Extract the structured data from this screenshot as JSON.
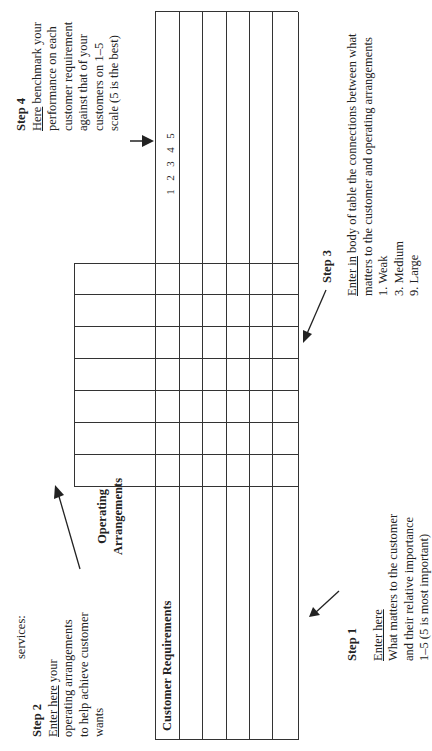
{
  "diagram": {
    "type": "quality-function-deployment-matrix",
    "orientation": "rotated-90-ccw"
  },
  "step1": {
    "title": "Step 1",
    "link": "Enter here",
    "lines": [
      "What matters to the customer",
      "and their relative importance",
      "1–5 (5 is most important)"
    ]
  },
  "step2": {
    "intro": "services:",
    "title": "Step 2",
    "link": "Enter here",
    "link_rest": " your",
    "lines": [
      "operating arrangements",
      "to help achieve customer",
      "wants"
    ]
  },
  "step3": {
    "title": "Step 3",
    "link": "Enter in",
    "link_rest": " body of table the connections between what",
    "line2": "matters to the customer and operating arrangements",
    "scale": [
      "1.  Weak",
      "3.  Medium",
      "9.  Large"
    ]
  },
  "step4": {
    "title": "Step 4",
    "link": "Here",
    "link_rest": " benchmark your",
    "lines": [
      "performance on each",
      "customer requirement",
      "against that of your",
      "customers on 1–5",
      "scale (5 is the best)"
    ]
  },
  "table": {
    "customer_requirements_header": "Customer Requirements",
    "operating_arrangements_header_1": "Operating",
    "operating_arrangements_header_2": "Arrangements",
    "benchmark_scale": [
      "1",
      "2",
      "3",
      "4",
      "5"
    ],
    "operating_columns": 7,
    "requirement_rows": 5
  },
  "colors": {
    "line": "#333333",
    "text": "#222222",
    "background": "#ffffff"
  }
}
